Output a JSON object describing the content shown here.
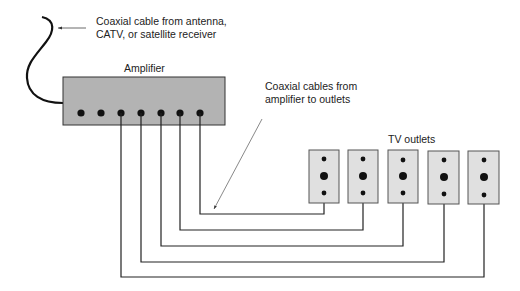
{
  "labels": {
    "source_line1": "Coaxial cable from antenna,",
    "source_line2": "CATV, or satellite receiver",
    "amplifier": "Amplifier",
    "cables_line1": "Coaxial cables from",
    "cables_line2": "amplifier to outlets",
    "outlets": "TV outlets"
  },
  "amplifier": {
    "ports": 7,
    "connected_ports": 5,
    "fill": "#b3b3b3"
  },
  "outlets": {
    "count": 5,
    "fill": "#e0e0e0"
  },
  "colors": {
    "line": "#1a1a1a",
    "text": "#222222"
  }
}
